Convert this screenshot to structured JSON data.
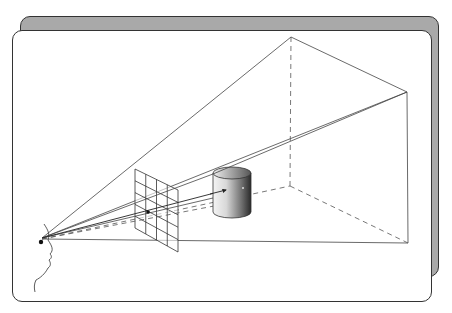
{
  "figure": {
    "caption_clipped": "",
    "elements": {
      "viewer": "human-profile",
      "eye_point": [
        40,
        239
      ],
      "picture_plane": "grid-4x5",
      "object": "shaded-cylinder",
      "frustum_apex": [
        291,
        37
      ],
      "frustum_right_top": [
        407,
        92
      ],
      "frustum_right_bottom": [
        408,
        243
      ],
      "frustum_inner_corner": [
        290,
        186
      ]
    },
    "colors": {
      "card_shadow": "#a9a9a9",
      "line": "#333333",
      "dashed": "#555555",
      "card_bg": "#ffffff"
    }
  }
}
